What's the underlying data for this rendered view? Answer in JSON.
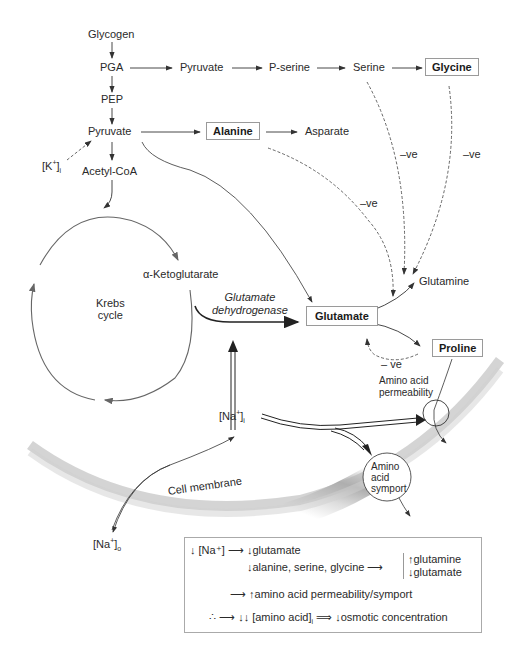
{
  "diagram": {
    "nodes": {
      "glycogen": "Glycogen",
      "pga": "PGA",
      "pyruvate_top": "Pyruvate",
      "p_serine": "P-serine",
      "serine": "Serine",
      "glycine": "Glycine",
      "pep": "PEP",
      "pyruvate": "Pyruvate",
      "alanine": "Alanine",
      "asparate": "Asparate",
      "k_i": "[K",
      "k_sup": "+",
      "k_sub": "i",
      "acetyl_coa": "Acetyl-CoA",
      "alpha_kg": "α-Ketoglutarate",
      "krebs_line1": "Krebs",
      "krebs_line2": "cycle",
      "enzyme_line1": "Glutamate",
      "enzyme_line2": "dehydrogenase",
      "glutamate": "Glutamate",
      "glutamine": "Glutamine",
      "proline": "Proline",
      "aa_perm_line1": "Amino acid",
      "aa_perm_line2": "permeability",
      "na_i": "[Na",
      "na_sup": "+",
      "na_i_sub": "i",
      "aa_symport_line1": "Amino",
      "aa_symport_line2": "acid",
      "aa_symport_line3": "symport",
      "cell_membrane": "Cell membrane",
      "na_o": "[Na",
      "na_o_sup": "+",
      "na_o_sub": "o"
    },
    "inhibition_labels": {
      "neg1": "–ve",
      "neg2": "–ve",
      "neg3": "–ve",
      "neg4": "– ve"
    },
    "colors": {
      "line": "#333333",
      "cycle": "#666666",
      "membrane_dark": "#9a9a9a",
      "membrane_light": "#f4f4f4",
      "box_border": "#9a9a9a"
    }
  },
  "legend": {
    "row1": {
      "down": "↓",
      "na": "[Na⁺]",
      "arrow": "⟶",
      "down2": "↓",
      "text": "glutamate"
    },
    "row2": {
      "down": "↓",
      "text": "alanine, serine, glycine",
      "arrow": "⟶",
      "up_item": "glutamine",
      "down_item": "glutamate",
      "up": "↑",
      "down2": "↓"
    },
    "row3": {
      "arrow": "⟶",
      "up": "↑",
      "text": "amino acid permeability/symport"
    },
    "row4": {
      "therefore": "∴",
      "arrow": "⟶",
      "dd": "↓↓",
      "text": "[amino acid]",
      "sub": "i",
      "implies": "⟹",
      "down": "↓",
      "result": "osmotic concentration"
    }
  }
}
